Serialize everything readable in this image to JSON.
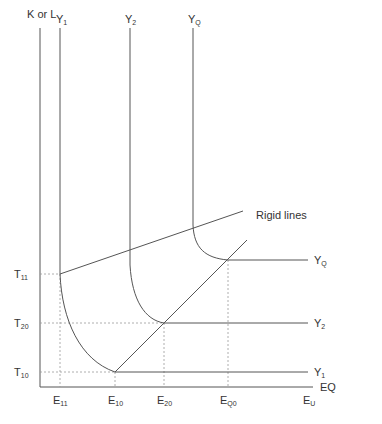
{
  "axes": {
    "y_label": "K or L",
    "x_label": "EQ"
  },
  "curves": [
    {
      "base": "Y",
      "sub": "1",
      "top_x": 60,
      "right_label_y": 372
    },
    {
      "base": "Y",
      "sub": "2",
      "top_x": 130,
      "right_label_y": 323
    },
    {
      "base": "Y",
      "sub": "Q",
      "top_x": 193,
      "right_label_y": 260
    }
  ],
  "y_ticks": [
    {
      "base": "T",
      "sub": "11",
      "y": 274
    },
    {
      "base": "T",
      "sub": "20",
      "y": 323
    },
    {
      "base": "T",
      "sub": "10",
      "y": 372
    }
  ],
  "x_ticks": [
    {
      "base": "E",
      "sub": "11",
      "x": 60
    },
    {
      "base": "E",
      "sub": "10",
      "x": 115
    },
    {
      "base": "E",
      "sub": "20",
      "x": 164
    },
    {
      "base": "E",
      "sub": "Q0",
      "x": 228
    },
    {
      "base": "E",
      "sub": "U",
      "x": 306
    }
  ],
  "annotation": "Rigid lines",
  "colors": {
    "line": "#555555",
    "dashed": "#999999",
    "text": "#333333"
  }
}
